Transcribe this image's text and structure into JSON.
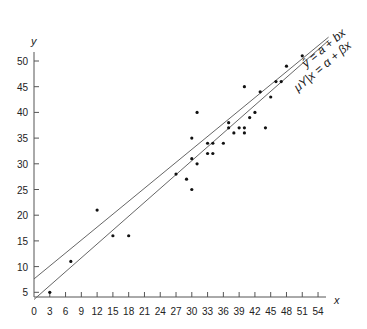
{
  "chart_data": {
    "type": "scatter",
    "title": "",
    "xlabel": "x",
    "ylabel": "y",
    "xlim": [
      0,
      56
    ],
    "ylim": [
      1,
      53
    ],
    "grid": false,
    "x_ticks": [
      0,
      3,
      6,
      9,
      12,
      15,
      18,
      21,
      24,
      27,
      30,
      33,
      36,
      39,
      42,
      45,
      48,
      51,
      54
    ],
    "y_ticks": [
      5,
      10,
      15,
      20,
      25,
      30,
      35,
      40,
      45,
      50
    ],
    "points": [
      [
        3,
        5
      ],
      [
        7,
        11
      ],
      [
        12,
        21
      ],
      [
        15,
        16
      ],
      [
        18,
        16
      ],
      [
        27,
        28
      ],
      [
        29,
        27
      ],
      [
        30,
        25
      ],
      [
        30,
        31
      ],
      [
        30,
        35
      ],
      [
        31,
        30
      ],
      [
        31,
        40
      ],
      [
        33,
        32
      ],
      [
        33,
        34
      ],
      [
        34,
        32
      ],
      [
        34,
        34
      ],
      [
        36,
        34
      ],
      [
        37,
        37
      ],
      [
        37,
        38
      ],
      [
        38,
        36
      ],
      [
        39,
        37
      ],
      [
        40,
        36
      ],
      [
        40,
        37
      ],
      [
        40,
        45
      ],
      [
        41,
        39
      ],
      [
        42,
        40
      ],
      [
        43,
        44
      ],
      [
        44,
        37
      ],
      [
        45,
        43
      ],
      [
        46,
        46
      ],
      [
        47,
        46
      ],
      [
        48,
        49
      ],
      [
        51,
        51
      ]
    ],
    "series": [
      {
        "name": "fitted",
        "label": "ŷ = a + bx",
        "intercept": 7.6,
        "slope": 0.84
      },
      {
        "name": "true",
        "label": "μY|x = α + βx",
        "intercept": 3.6,
        "slope": 0.9
      }
    ],
    "annotations": [
      {
        "text": "ŷ = a + bx",
        "position": "upper line end"
      },
      {
        "text": "μY/x = α + βx",
        "position": "lower line end"
      }
    ]
  }
}
